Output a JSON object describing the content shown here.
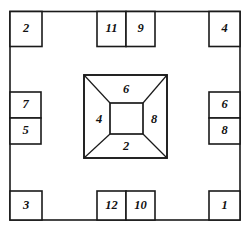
{
  "diagram": {
    "type": "labeled-frame-with-central-frustum",
    "stroke_color": "#1a1a1a",
    "background_color": "#ffffff",
    "frame": {
      "name": "outer-rectangle"
    },
    "edge_boxes": [
      {
        "id": "box-2",
        "label": "2",
        "edge": "top",
        "position": "top-left-corner"
      },
      {
        "id": "box-11",
        "label": "11",
        "edge": "top",
        "position": "top-center-left"
      },
      {
        "id": "box-9",
        "label": "9",
        "edge": "top",
        "position": "top-center-right"
      },
      {
        "id": "box-4",
        "label": "4",
        "edge": "top",
        "position": "top-right-corner"
      },
      {
        "id": "box-7",
        "label": "7",
        "edge": "left",
        "position": "left-upper"
      },
      {
        "id": "box-5",
        "label": "5",
        "edge": "left",
        "position": "left-lower"
      },
      {
        "id": "box-6r",
        "label": "6",
        "edge": "right",
        "position": "right-upper"
      },
      {
        "id": "box-8r",
        "label": "8",
        "edge": "right",
        "position": "right-lower"
      },
      {
        "id": "box-3",
        "label": "3",
        "edge": "bottom",
        "position": "bottom-left-corner"
      },
      {
        "id": "box-12",
        "label": "12",
        "edge": "bottom",
        "position": "bottom-center-left"
      },
      {
        "id": "box-10",
        "label": "10",
        "edge": "bottom",
        "position": "bottom-center-right"
      },
      {
        "id": "box-1",
        "label": "1",
        "edge": "bottom",
        "position": "bottom-right-corner"
      }
    ],
    "center_figure": {
      "name": "truncated-pyramid",
      "faces": [
        {
          "id": "face-top",
          "label": "6",
          "position": "top"
        },
        {
          "id": "face-left",
          "label": "4",
          "position": "left"
        },
        {
          "id": "face-right",
          "label": "8",
          "position": "right"
        },
        {
          "id": "face-bottom",
          "label": "2",
          "position": "bottom"
        }
      ]
    }
  }
}
